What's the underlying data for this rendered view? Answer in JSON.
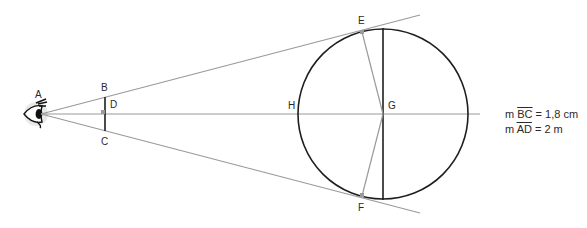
{
  "diagram": {
    "type": "geometry-eye-sphere-angle",
    "points": {
      "A": {
        "label": "A"
      },
      "B": {
        "label": "B"
      },
      "C": {
        "label": "C"
      },
      "D": {
        "label": "D"
      },
      "E": {
        "label": "E"
      },
      "F": {
        "label": "F"
      },
      "G": {
        "label": "G"
      },
      "H": {
        "label": "H"
      }
    },
    "legend": [
      {
        "prefix": "m ",
        "segment": "BC",
        "value": "= 1,8 cm"
      },
      {
        "prefix": "m ",
        "segment": "AD",
        "value": "= 2 m"
      }
    ],
    "colors": {
      "gray_line": "#9a9a9a",
      "dark_line": "#1e1e1e",
      "right_angle_marker": "#9a9a9a"
    }
  }
}
